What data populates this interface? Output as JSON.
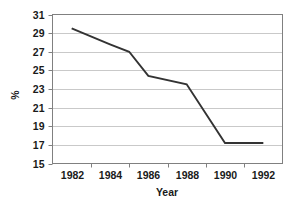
{
  "chart_data": {
    "type": "line",
    "title": "",
    "xlabel": "Year",
    "ylabel": "%",
    "xlim": [
      1981,
      1993
    ],
    "ylim": [
      15,
      31
    ],
    "grid": true,
    "legend": false,
    "x": [
      1982,
      1984,
      1985,
      1986,
      1988,
      1990,
      1992
    ],
    "values": [
      29.5,
      27.8,
      27.0,
      24.4,
      23.5,
      17.2,
      17.2
    ],
    "series": [
      {
        "name": "%",
        "x": [
          1982,
          1984,
          1985,
          1986,
          1988,
          1990,
          1992
        ],
        "values": [
          29.5,
          27.8,
          27.0,
          24.4,
          23.5,
          17.2,
          17.2
        ],
        "color": "#333333"
      }
    ],
    "xticks": [
      1982,
      1984,
      1986,
      1988,
      1990,
      1992
    ],
    "xticklabels": [
      "1982",
      "1984",
      "1986",
      "1988",
      "1990",
      "1992"
    ],
    "yticks": [
      15,
      17,
      19,
      21,
      23,
      25,
      27,
      29,
      31
    ],
    "yticklabels": [
      "15",
      "17",
      "19",
      "21",
      "23",
      "25",
      "27",
      "29",
      "31"
    ],
    "colors": {
      "line": "#333333",
      "grid": "#c9c9c9",
      "frame": "#808080",
      "text": "#1a1a1a",
      "background": "#ffffff"
    }
  },
  "axes": {
    "y_axis_label": "%",
    "x_axis_label": "Year"
  }
}
